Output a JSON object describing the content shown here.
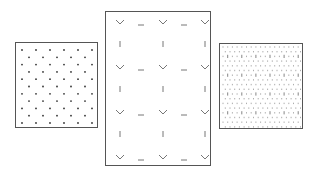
{
  "figure": {
    "panels": [
      {
        "id": "left",
        "pattern": "staggered-dot-lattice",
        "rows": 11,
        "cols_even_rows": 6,
        "cols_odd_rows": 5,
        "dot_color": "#333333"
      },
      {
        "id": "middle",
        "pattern": "chevron-dash-lattice",
        "chevron_rows": 4,
        "chevrons_per_row": 3,
        "dashes_per_row": 2,
        "bar_rows": 3,
        "bars_per_row": 3,
        "stroke_color": "#666666"
      },
      {
        "id": "right",
        "pattern": "fine-stipple-lattice",
        "rows": 18,
        "cols": 17,
        "tick_color": "#777777"
      }
    ],
    "border_color": "#555555"
  }
}
